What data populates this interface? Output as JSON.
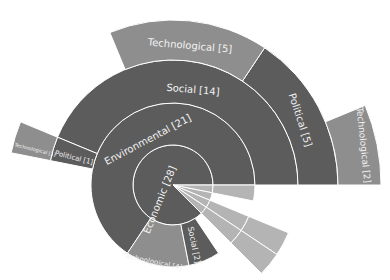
{
  "chart_data": {
    "type": "sunburst",
    "title": "",
    "center": [
      173,
      185
    ],
    "ring_radii": [
      0,
      40,
      82,
      125,
      165,
      208
    ],
    "total": 32,
    "colors": {
      "dark": "#5c5c5c",
      "tech": "#8e8e8e",
      "light": "#b4b4b4",
      "border": "#ffffff"
    },
    "nodes": [
      {
        "label": "Economic [28]",
        "value": 28,
        "ring": 0,
        "start": 0,
        "end": 315,
        "color": "dark"
      },
      {
        "label": "Environmental [21]",
        "value": 21,
        "ring": 1,
        "start": 0,
        "end": 236.25,
        "color": "dark"
      },
      {
        "label": "Technological [4]",
        "value": 4,
        "ring": 1,
        "start": 236.25,
        "end": 281.25,
        "color": "tech"
      },
      {
        "label": "Social [2]",
        "value": 2,
        "ring": 1,
        "start": 281.25,
        "end": 303.75,
        "color": "dark"
      },
      {
        "label": "Social [14]",
        "value": 14,
        "ring": 2,
        "start": 0,
        "end": 157.5,
        "color": "dark"
      },
      {
        "label": "Political [1]",
        "value": 1,
        "ring": 2,
        "start": 157.5,
        "end": 168.75,
        "color": "dark"
      },
      {
        "label": "Political [5]",
        "value": 5,
        "ring": 3,
        "start": 0,
        "end": 56.25,
        "color": "dark"
      },
      {
        "label": "Technological [5]",
        "value": 5,
        "ring": 3,
        "start": 56.25,
        "end": 112.5,
        "color": "tech"
      },
      {
        "label": "Technological [1]",
        "value": 1,
        "ring": 3,
        "start": 157.5,
        "end": 168.75,
        "color": "tech"
      },
      {
        "label": "Technological [2]",
        "value": 2,
        "ring": 4,
        "start": 0,
        "end": 22.5,
        "color": "tech"
      },
      {
        "label": "Technological [1]",
        "value": 1,
        "ring": 0,
        "start": 348.75,
        "end": 360,
        "color": "light"
      },
      {
        "label": "Technological [1]",
        "value": 1,
        "ring": 1,
        "start": 348.75,
        "end": 360,
        "color": "light"
      },
      {
        "label": "Social [1]",
        "value": 1,
        "ring": 0,
        "start": 337.5,
        "end": 348.75,
        "color": "light"
      },
      {
        "label": "Technological [1]",
        "value": 1,
        "ring": 0,
        "start": 326.25,
        "end": 337.5,
        "color": "light"
      },
      {
        "label": "Technological [1]",
        "value": 1,
        "ring": 1,
        "start": 326.25,
        "end": 337.5,
        "color": "light"
      },
      {
        "label": "Technological [1]",
        "value": 1,
        "ring": 2,
        "start": 326.25,
        "end": 337.5,
        "color": "light"
      },
      {
        "label": "Technological [1]",
        "value": 1,
        "ring": 0,
        "start": 315,
        "end": 326.25,
        "color": "light"
      },
      {
        "label": "Technological [1]",
        "value": 1,
        "ring": 1,
        "start": 315,
        "end": 326.25,
        "color": "light"
      },
      {
        "label": "Technological [1]",
        "value": 1,
        "ring": 2,
        "start": 315,
        "end": 326.25,
        "color": "light"
      }
    ],
    "labels": [
      {
        "text": "Economic [28]",
        "x": 160,
        "y": 200,
        "rot": -68,
        "size": 10
      },
      {
        "text": "Environmental [21]",
        "x": 148,
        "y": 140,
        "rot": -28,
        "size": 10
      },
      {
        "text": "Social [14]",
        "x": 193,
        "y": 90,
        "rot": 5,
        "size": 10
      },
      {
        "text": "Technological [5]",
        "x": 190,
        "y": 46,
        "rot": 5,
        "size": 10
      },
      {
        "text": "Political [5]",
        "x": 300,
        "y": 120,
        "rot": 72,
        "size": 10
      },
      {
        "text": "Technological [2]",
        "x": 363,
        "y": 145,
        "rot": 84,
        "size": 9
      },
      {
        "text": "Political [1]",
        "x": 74,
        "y": 158,
        "rot": 14,
        "size": 7
      },
      {
        "text": "Technological [1]",
        "x": 35,
        "y": 150,
        "rot": 14,
        "size": 5
      },
      {
        "text": "Technological [4]",
        "x": 153,
        "y": 262,
        "rot": 12,
        "size": 7
      },
      {
        "text": "Social [2]",
        "x": 194,
        "y": 245,
        "rot": 78,
        "size": 8
      }
    ]
  }
}
